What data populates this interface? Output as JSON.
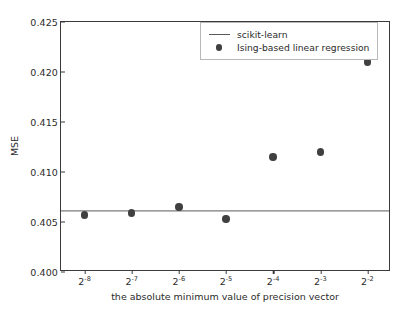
{
  "chart_data": {
    "type": "scatter",
    "title": "",
    "xlabel": "the absolute minimum value of precision vector",
    "ylabel": "MSE",
    "xtick_labels": [
      "2-8",
      "2-7",
      "2-6",
      "2-5",
      "2-4",
      "2-3",
      "2-2"
    ],
    "xtick_bases": [
      "2",
      "2",
      "2",
      "2",
      "2",
      "2",
      "2"
    ],
    "xtick_exponents": [
      "-8",
      "-7",
      "-6",
      "-5",
      "-4",
      "-3",
      "-2"
    ],
    "x": [
      -8,
      -7,
      -6,
      -5,
      -4,
      -3,
      -2
    ],
    "ytick_labels": [
      "0.400",
      "0.405",
      "0.410",
      "0.415",
      "0.420",
      "0.425"
    ],
    "ytick_values": [
      0.4,
      0.405,
      0.41,
      0.415,
      0.42,
      0.425
    ],
    "ylim": [
      0.4,
      0.425
    ],
    "xlim": [
      -8.5,
      -1.5
    ],
    "grid": false,
    "legend_position": "upper right",
    "series": [
      {
        "name": "scikit-learn",
        "kind": "hline",
        "value": 0.4061,
        "color": "#5a5a5a"
      },
      {
        "name": "Ising-based linear regression",
        "kind": "scatter",
        "color": "#404040",
        "values": [
          0.4057,
          0.4059,
          0.4065,
          0.4053,
          0.4115,
          0.412,
          0.421
        ]
      }
    ]
  },
  "legend": {
    "items": [
      {
        "label": "scikit-learn",
        "key": "line"
      },
      {
        "label": "Ising-based linear regression",
        "key": "dot"
      }
    ]
  }
}
